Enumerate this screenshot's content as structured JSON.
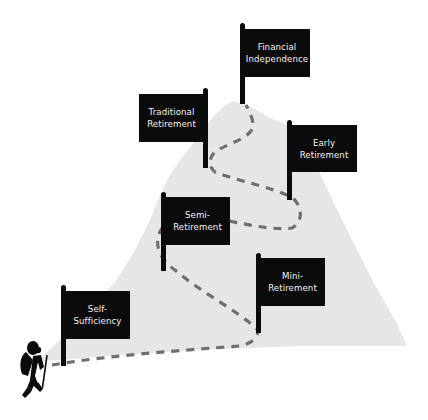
{
  "diagram": {
    "type": "mountain-path-milestones",
    "colors": {
      "background": "#ffffff",
      "mountain": "#e6e6e6",
      "flag": "#0b0b0b",
      "flag_text": "#f2f2f2",
      "path": "#6f6f6f"
    },
    "milestones": [
      {
        "id": "self-sufficiency",
        "line1": "Self-",
        "line2": "Sufficiency",
        "order": 1
      },
      {
        "id": "mini-retirement",
        "line1": "Mini-",
        "line2": "Retirement",
        "order": 2
      },
      {
        "id": "semi-retirement",
        "line1": "Semi-",
        "line2": "Retirement",
        "order": 3
      },
      {
        "id": "early-retirement",
        "line1": "Early",
        "line2": "Retirement",
        "order": 4
      },
      {
        "id": "traditional-retirement",
        "line1": "Traditional",
        "line2": "Retirement",
        "order": 5
      },
      {
        "id": "financial-independence",
        "line1": "Financial",
        "line2": "Independence",
        "order": 6
      }
    ],
    "figure": "hiker-with-walking-stick"
  }
}
